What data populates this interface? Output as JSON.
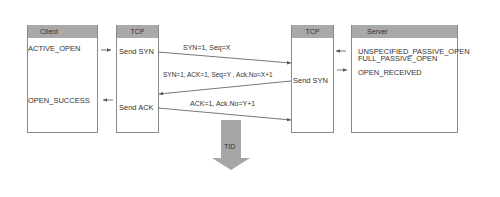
{
  "diagram": {
    "type": "sequence",
    "client": {
      "header": "Client",
      "events": [
        "ACTIVE_OPEN",
        "OPEN_SUCCESS"
      ]
    },
    "tcp_left": {
      "header": "TCP",
      "actions": [
        "Send SYN",
        "Send ACK"
      ]
    },
    "tcp_right": {
      "header": "TCP",
      "actions": [
        "Send SYN"
      ]
    },
    "server": {
      "header": "Server",
      "events": [
        "UNSPECIFIED_PASSIVE_OPEN",
        "FULL_PASSIVE_OPEN",
        "OPEN_RECEIVED"
      ]
    },
    "messages": [
      {
        "label": "SYN=1, Seq=X",
        "from": "tcp_left",
        "to": "tcp_right"
      },
      {
        "label": "SYN=1, ACK=1, Seq=Y , Ack.No=X+1",
        "from": "tcp_right",
        "to": "tcp_left"
      },
      {
        "label": "ACK=1, Ack.No=Y+1",
        "from": "tcp_left",
        "to": "tcp_right"
      }
    ],
    "result_arrow": {
      "label": "TID"
    },
    "colors": {
      "header_fill": "#a9a9a9",
      "line": "#555555",
      "box_border": "#8a8a8a",
      "tid_arrow": "#a6a6a6"
    }
  }
}
